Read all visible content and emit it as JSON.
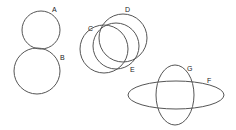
{
  "diagram": {
    "title": "",
    "stroke_color": "#555555",
    "shapes": [
      {
        "id": "A",
        "label": "A",
        "type": "circle",
        "cx": 41,
        "cy": 30,
        "r": 19,
        "label_x": 52,
        "label_y": 12
      },
      {
        "id": "B",
        "label": "B",
        "type": "circle",
        "cx": 37,
        "cy": 71,
        "r": 23,
        "label_x": 60,
        "label_y": 60
      },
      {
        "id": "C",
        "label": "C",
        "type": "circle",
        "cx": 104,
        "cy": 49,
        "r": 24,
        "label_x": 88,
        "label_y": 31
      },
      {
        "id": "D",
        "label": "D",
        "type": "circle",
        "cx": 123,
        "cy": 38,
        "r": 24,
        "label_x": 125,
        "label_y": 12
      },
      {
        "id": "E",
        "label": "E",
        "type": "circle",
        "cx": 116,
        "cy": 46,
        "r": 23,
        "label_x": 130,
        "label_y": 72
      },
      {
        "id": "F",
        "label": "F",
        "type": "ellipse",
        "cx": 176,
        "cy": 95,
        "rx": 48,
        "ry": 14,
        "label_x": 207,
        "label_y": 83
      },
      {
        "id": "G",
        "label": "G",
        "type": "ellipse",
        "cx": 175,
        "cy": 95,
        "rx": 19,
        "ry": 30,
        "label_x": 187,
        "label_y": 71
      }
    ]
  }
}
